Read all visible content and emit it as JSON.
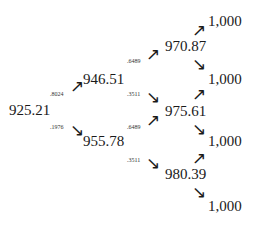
{
  "tree": {
    "nodes": {
      "root": "925.21",
      "up1": "946.51",
      "down1": "955.78",
      "uu": "970.87",
      "ud": "975.61",
      "dd": "980.39",
      "leaf1": "1,000",
      "leaf2": "1,000",
      "leaf3": "1,000",
      "leaf4": "1,000"
    },
    "probabilities": {
      "root_up": ".8024",
      "root_down": ".1976",
      "up1_up": ".6489",
      "up1_down": ".3511",
      "down1_up": ".6489",
      "down1_down": ".3511"
    },
    "arrows": {
      "up": "↗",
      "down": "↘"
    }
  }
}
